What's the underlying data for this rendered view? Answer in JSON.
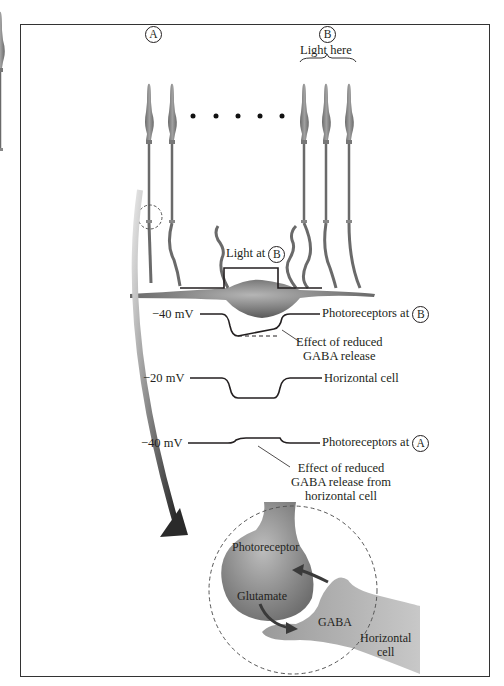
{
  "figure": {
    "top": {
      "marker_a": "A",
      "marker_b": "B",
      "light_here": "Light here"
    },
    "traces": {
      "light_label": "Light at",
      "light_marker": "B",
      "trace1_voltage": "−40 mV",
      "trace1_label": "Photoreceptors at",
      "trace1_marker": "B",
      "trace1_note_line1": "Effect of reduced",
      "trace1_note_line2": "GABA release",
      "trace2_voltage": "−20 mV",
      "trace2_label": "Horizontal cell",
      "trace3_voltage": "−40 mV",
      "trace3_label": "Photoreceptors at",
      "trace3_marker": "A",
      "trace3_note_line1": "Effect of reduced",
      "trace3_note_line2": "GABA release from",
      "trace3_note_line3": "horizontal cell"
    },
    "synapse": {
      "photoreceptor": "Photoreceptor",
      "glutamate": "Glutamate",
      "gaba": "GABA",
      "horizontal_line1": "Horizontal",
      "horizontal_line2": "cell"
    }
  }
}
